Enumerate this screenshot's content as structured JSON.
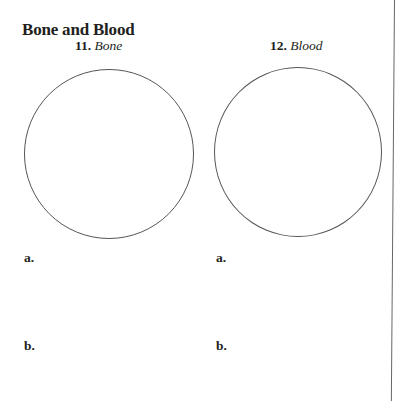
{
  "section": {
    "title": "Bone and Blood"
  },
  "questions": [
    {
      "number": "11.",
      "term": "Bone",
      "answers": [
        {
          "label": "a."
        },
        {
          "label": "b."
        }
      ]
    },
    {
      "number": "12.",
      "term": "Blood",
      "answers": [
        {
          "label": "a."
        },
        {
          "label": "b."
        }
      ]
    }
  ]
}
